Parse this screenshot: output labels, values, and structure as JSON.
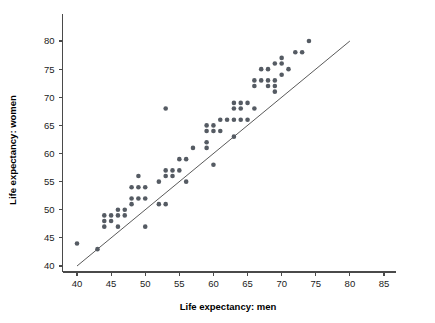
{
  "chart_data": {
    "type": "scatter",
    "title": "",
    "xlabel": "Life expectancy: men",
    "ylabel": "Life expectancy: women",
    "xlim": [
      37.5,
      87
    ],
    "ylim": [
      38.2,
      82.5
    ],
    "xticks": [
      40,
      45,
      50,
      55,
      60,
      65,
      70,
      75,
      80,
      85
    ],
    "yticks": [
      40,
      45,
      50,
      55,
      60,
      65,
      70,
      75,
      80
    ],
    "xtick_labels": [
      "40",
      "45",
      "50",
      "55",
      "60",
      "65",
      "70",
      "75",
      "80",
      "85"
    ],
    "ytick_labels": [
      "40",
      "45",
      "50",
      "55",
      "60",
      "65",
      "70",
      "75",
      "80"
    ],
    "grid": false,
    "legend": null,
    "point_color": "#555b63",
    "point_size": 2.3,
    "reference_line": {
      "description": "y = x identity line",
      "x_start": 40,
      "y_start": 40,
      "x_end": 80,
      "y_end": 80,
      "color": "#5a5a5a"
    },
    "points": [
      [
        40,
        44
      ],
      [
        43,
        43
      ],
      [
        44,
        48
      ],
      [
        44,
        47
      ],
      [
        44,
        49
      ],
      [
        45,
        48
      ],
      [
        45,
        49
      ],
      [
        46,
        50
      ],
      [
        46,
        49
      ],
      [
        46,
        47
      ],
      [
        47,
        50
      ],
      [
        47,
        49
      ],
      [
        48,
        52
      ],
      [
        48,
        51
      ],
      [
        48,
        54
      ],
      [
        49,
        54
      ],
      [
        49,
        52
      ],
      [
        49,
        56
      ],
      [
        50,
        54
      ],
      [
        50,
        52
      ],
      [
        50,
        47
      ],
      [
        52,
        55
      ],
      [
        52,
        51
      ],
      [
        53,
        56
      ],
      [
        53,
        57
      ],
      [
        53,
        51
      ],
      [
        53,
        68
      ],
      [
        54,
        57
      ],
      [
        54,
        56
      ],
      [
        55,
        59
      ],
      [
        55,
        57
      ],
      [
        56,
        59
      ],
      [
        56,
        55
      ],
      [
        57,
        61
      ],
      [
        59,
        65
      ],
      [
        59,
        64
      ],
      [
        59,
        62
      ],
      [
        59,
        61
      ],
      [
        60,
        65
      ],
      [
        60,
        64
      ],
      [
        60,
        58
      ],
      [
        61,
        66
      ],
      [
        61,
        64
      ],
      [
        62,
        66
      ],
      [
        63,
        69
      ],
      [
        63,
        68
      ],
      [
        63,
        66
      ],
      [
        63,
        63
      ],
      [
        64,
        69
      ],
      [
        64,
        68
      ],
      [
        64,
        66
      ],
      [
        65,
        69
      ],
      [
        65,
        66
      ],
      [
        66,
        72
      ],
      [
        66,
        73
      ],
      [
        66,
        68
      ],
      [
        67,
        75
      ],
      [
        67,
        73
      ],
      [
        68,
        75
      ],
      [
        68,
        73
      ],
      [
        68,
        72
      ],
      [
        69,
        76
      ],
      [
        69,
        73
      ],
      [
        69,
        72
      ],
      [
        69,
        71
      ],
      [
        70,
        77
      ],
      [
        70,
        76
      ],
      [
        70,
        74
      ],
      [
        71,
        75
      ],
      [
        72,
        78
      ],
      [
        73,
        78
      ],
      [
        74,
        80
      ]
    ]
  }
}
